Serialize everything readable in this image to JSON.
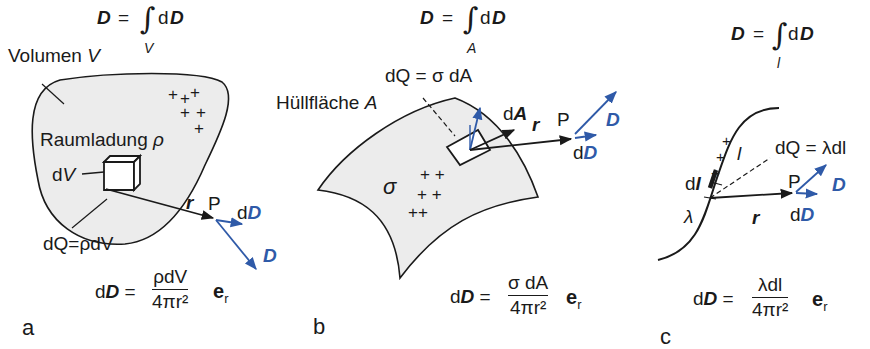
{
  "colors": {
    "ink": "#1a1a1a",
    "vector_blue": "#2f5aa8",
    "region_fill": "#ececec"
  },
  "panels": [
    {
      "label": "a",
      "integral": {
        "lhs": "D",
        "eq": "=",
        "sign": "∫",
        "limit": "V",
        "d": "d",
        "rhs": "D"
      },
      "region_label": {
        "text": "Volumen ",
        "var": "V"
      },
      "charge_label": {
        "text": "Raumladung ",
        "var": "ρ"
      },
      "element_label": {
        "d": "d",
        "var": "V"
      },
      "charge_element": "dQ=ρdV",
      "position_vector": "r",
      "point": "P",
      "dD_label": {
        "d": "d",
        "var": "D"
      },
      "D_label": "D",
      "formula": {
        "lhs_d": "d",
        "lhs": "D",
        "eq": "=",
        "numerator": "ρdV",
        "denominator": "4πr²",
        "unit": "e",
        "unit_sub": "r"
      }
    },
    {
      "label": "b",
      "integral": {
        "lhs": "D",
        "eq": "=",
        "sign": "∫",
        "limit": "A",
        "d": "d",
        "rhs": "D"
      },
      "charge_element": "dQ = σ dA",
      "region_label": {
        "text": "Hüllfläche ",
        "var": "A"
      },
      "area_vector": {
        "d": "d",
        "var": "A"
      },
      "position_vector": "r",
      "point": "P",
      "D_label": "D",
      "dD_label": {
        "d": "d",
        "var": "D"
      },
      "charge_label": "σ",
      "formula": {
        "lhs_d": "d",
        "lhs": "D",
        "eq": "=",
        "numerator": "σ dA",
        "denominator": "4πr²",
        "unit": "e",
        "unit_sub": "r"
      }
    },
    {
      "label": "c",
      "integral": {
        "lhs": "D",
        "eq": "=",
        "sign": "∫",
        "limit": "l",
        "d": "d",
        "rhs": "D"
      },
      "charge_element": "dQ = λdl",
      "curve_label": "l",
      "element_label": {
        "d": "d",
        "var": "l"
      },
      "charge_label": "λ",
      "position_vector": "r",
      "point": "P",
      "D_label": "D",
      "dD_label": {
        "d": "d",
        "var": "D"
      },
      "formula": {
        "lhs_d": "d",
        "lhs": "D",
        "eq": "=",
        "numerator": "λdl",
        "denominator": "4πr²",
        "unit": "e",
        "unit_sub": "r"
      }
    }
  ],
  "plus_sign": "+"
}
